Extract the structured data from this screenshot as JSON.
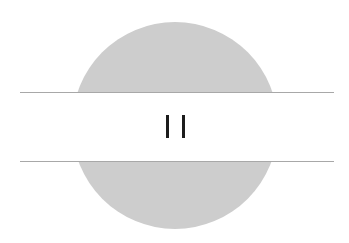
{
  "graphic": {
    "description": "Gray circle bisected by a white horizontal band with a pause glyph",
    "icon": "pause-icon",
    "colors": {
      "background": "#ffffff",
      "circle": "#cdcdcd",
      "lines": "#a8a8a8",
      "glyph": "#1c1c1c"
    }
  }
}
